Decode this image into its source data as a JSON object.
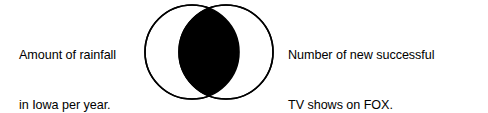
{
  "canvas": {
    "width": 488,
    "height": 112,
    "background_color": "#ffffff"
  },
  "caption_left": {
    "name": "left-set-label",
    "line1": "Amount of rainfall",
    "line2": "in Iowa per year.",
    "full_text": "Amount of rainfall in Iowa per year.",
    "color": "#000000"
  },
  "caption_right": {
    "name": "right-set-label",
    "line1": "Number of new successful",
    "line2": "TV shows on FOX.",
    "full_text": "Number of new successful TV shows on FOX.",
    "color": "#000000"
  },
  "venn": {
    "name": "venn-diagram",
    "stroke_color": "#000000",
    "stroke_width": 1.6,
    "fill_color": "#ffffff",
    "intersection_fill_color": "#000000",
    "left_circle": {
      "name": "left-circle",
      "cx": 50,
      "cy": 50,
      "r": 47
    },
    "right_circle": {
      "name": "right-circle",
      "cx": 84,
      "cy": 50,
      "r": 47
    }
  }
}
